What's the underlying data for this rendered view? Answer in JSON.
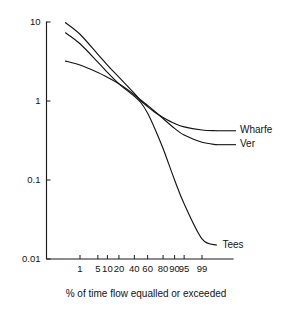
{
  "chart_data": {
    "type": "line",
    "title": "",
    "subtitle": "",
    "xlabel": "% of time flow equalled or exceeded",
    "ylabel": "",
    "x_scale": "probability",
    "y_scale": "log10",
    "ylim": [
      0.01,
      10
    ],
    "xlim": [
      0.1,
      99.9
    ],
    "grid": false,
    "legend_position": "right-inline-labels",
    "y_tick_labels": [
      "10",
      "1",
      "0.1",
      "0.01"
    ],
    "y_tick_values": [
      10,
      1,
      0.1,
      0.01
    ],
    "x_tick_labels": [
      "1",
      "5",
      "10",
      "20",
      "40",
      "60",
      "80",
      "90",
      "95",
      "99"
    ],
    "x_tick_values": [
      1,
      5,
      10,
      20,
      40,
      60,
      80,
      90,
      95,
      99
    ],
    "x": [
      0.2,
      1,
      5,
      10,
      20,
      40,
      50,
      60,
      70,
      80,
      90,
      95,
      99,
      99.8
    ],
    "series": [
      {
        "name": "Wharfe",
        "label": "Wharfe",
        "values": [
          9.8,
          7.0,
          3.9,
          2.85,
          2.0,
          1.25,
          1.0,
          0.85,
          0.72,
          0.62,
          0.52,
          0.47,
          0.43,
          0.42
        ]
      },
      {
        "name": "Ver",
        "label": "Ver",
        "values": [
          3.2,
          2.85,
          2.3,
          2.0,
          1.65,
          1.2,
          1.02,
          0.88,
          0.74,
          0.6,
          0.45,
          0.37,
          0.3,
          0.28
        ]
      },
      {
        "name": "Tees",
        "label": "Tees",
        "values": [
          7.3,
          5.3,
          3.1,
          2.3,
          1.65,
          1.15,
          0.95,
          0.7,
          0.45,
          0.25,
          0.1,
          0.05,
          0.018,
          0.015
        ]
      }
    ],
    "annotations": [
      {
        "text": "Wharfe",
        "series": "Wharfe"
      },
      {
        "text": "Ver",
        "series": "Ver"
      },
      {
        "text": "Tees",
        "series": "Tees"
      }
    ]
  },
  "colors": {
    "ink": "#151515",
    "axis": "#1b1b1b",
    "background": "#ffffff"
  }
}
